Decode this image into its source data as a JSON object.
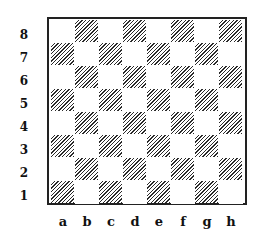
{
  "board": {
    "title": "",
    "files": [
      "a",
      "b",
      "c",
      "d",
      "e",
      "f",
      "g",
      "h"
    ],
    "ranks": [
      "8",
      "7",
      "6",
      "5",
      "4",
      "3",
      "2",
      "1"
    ],
    "light_square_color": "#ffffff",
    "dark_square_style": "diagonal-hatch",
    "dark_square_hatch_color": "#2a2a2a",
    "border_color": "#222222",
    "label_color": "#111111",
    "pieces": []
  }
}
